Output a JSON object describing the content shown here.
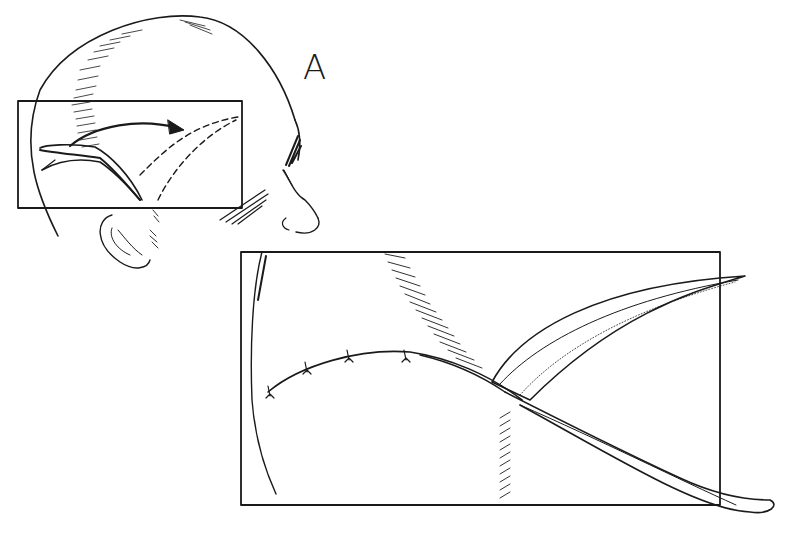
{
  "figure": {
    "panel_label": "A",
    "colors": {
      "ink": "#1a1a1a",
      "background": "#ffffff"
    },
    "elements": {
      "head_profile": "head-outline",
      "inset_small": "detail-box-head",
      "inset_large": "enlarged-detail-box",
      "arrow": "flap-rotation-arrow",
      "dashed_path": "planned-flap-position",
      "sutures": 4
    }
  }
}
